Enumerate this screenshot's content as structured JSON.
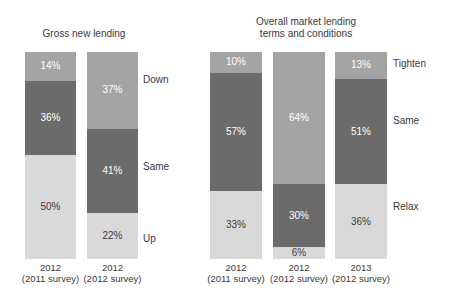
{
  "palette": {
    "background": "#ffffff",
    "segment_colors_top_to_bottom": [
      "#a4a4a4",
      "#6b6b6b",
      "#dad9d9"
    ],
    "value_label_on_dark": "#ffffff",
    "value_label_on_light": "#3a3a3a",
    "text_color": "#3a3a3a"
  },
  "chart_data": [
    {
      "type": "bar",
      "variant": "100%-stacked-column",
      "title": "Gross new lending",
      "title_lines": [
        "Gross new lending"
      ],
      "unit": "%",
      "categories": [
        [
          "2012",
          "(2011 survey)"
        ],
        [
          "2012",
          "(2012 survey)"
        ]
      ],
      "series": [
        {
          "name": "Down",
          "values": [
            14,
            37
          ]
        },
        {
          "name": "Same",
          "values": [
            36,
            41
          ]
        },
        {
          "name": "Up",
          "values": [
            50,
            22
          ]
        }
      ],
      "value_labels": [
        [
          "14%",
          "37%"
        ],
        [
          "36%",
          "41%"
        ],
        [
          "50%",
          "22%"
        ]
      ],
      "stack_order_top_to_bottom": [
        "Down",
        "Same",
        "Up"
      ],
      "legend_labels": [
        "Down",
        "Same",
        "Up"
      ],
      "legend_position": "right",
      "ylim": [
        0,
        100
      ],
      "grid": false
    },
    {
      "type": "bar",
      "variant": "100%-stacked-column",
      "title": "Overall market lending terms and conditions",
      "title_lines": [
        "Overall market lending",
        "terms and conditions"
      ],
      "unit": "%",
      "categories": [
        [
          "2012",
          "(2011 survey)"
        ],
        [
          "2012",
          "(2012 survey)"
        ],
        [
          "2013",
          "(2012 survey)"
        ]
      ],
      "series": [
        {
          "name": "Tighten",
          "values": [
            10,
            64,
            13
          ]
        },
        {
          "name": "Same",
          "values": [
            57,
            30,
            51
          ]
        },
        {
          "name": "Relax",
          "values": [
            33,
            6,
            36
          ]
        }
      ],
      "value_labels": [
        [
          "10%",
          "64%",
          "13%"
        ],
        [
          "57%",
          "30%",
          "51%"
        ],
        [
          "33%",
          "6%",
          "36%"
        ]
      ],
      "stack_order_top_to_bottom": [
        "Tighten",
        "Same",
        "Relax"
      ],
      "legend_labels": [
        "Tighten",
        "Same",
        "Relax"
      ],
      "legend_position": "right",
      "ylim": [
        0,
        100
      ],
      "grid": false
    }
  ]
}
